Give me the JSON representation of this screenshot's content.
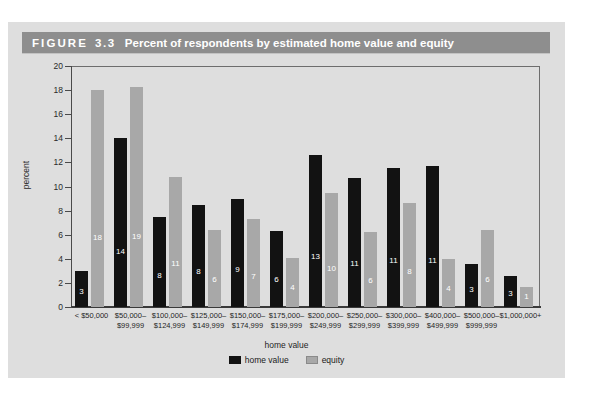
{
  "figure": {
    "label": "FIGURE",
    "number": "3.3",
    "title": "Percent of respondents by estimated home value and equity"
  },
  "colors": {
    "panel_background": "#dedede",
    "header_background": "#8e8e8e",
    "header_text": "#ffffff",
    "home_value_bar": "#121212",
    "equity_bar": "#a8a8a8",
    "axis": "#4a4a4a"
  },
  "chart_data": {
    "type": "bar",
    "title": "Percent of respondents by estimated home value and equity",
    "xlabel": "home value",
    "ylabel": "percent",
    "ylim": [
      0,
      20
    ],
    "yticks": [
      0,
      2,
      4,
      6,
      8,
      10,
      12,
      14,
      16,
      18,
      20
    ],
    "grid": false,
    "legend_position": "bottom-center",
    "categories": [
      "< $50,000",
      "$50,000–$99,999",
      "$100,000–$124,999",
      "$125,000–$149,999",
      "$150,000–$174,999",
      "$175,000–$199,999",
      "$200,000–$249,999",
      "$250,000–$299,999",
      "$300,000–$399,999",
      "$400,000–$499,999",
      "$500,000–$999,999",
      "$1,000,000+"
    ],
    "category_lines": [
      [
        "< $50,000",
        ""
      ],
      [
        "$50,000–",
        "$99,999"
      ],
      [
        "$100,000–",
        "$124,999"
      ],
      [
        "$125,000–",
        "$149,999"
      ],
      [
        "$150,000–",
        "$174,999"
      ],
      [
        "$175,000–",
        "$199,999"
      ],
      [
        "$200,000–",
        "$249,999"
      ],
      [
        "$250,000–",
        "$299,999"
      ],
      [
        "$300,000–",
        "$399,999"
      ],
      [
        "$400,000–",
        "$499,999"
      ],
      [
        "$500,000–",
        "$999,999"
      ],
      [
        "$1,000,000+",
        ""
      ]
    ],
    "series": [
      {
        "name": "home value",
        "color": "#121212",
        "values": [
          3.0,
          14.0,
          7.5,
          8.5,
          9.0,
          6.3,
          12.6,
          10.7,
          11.5,
          11.7,
          3.6,
          2.6
        ],
        "labels": [
          "3",
          "14",
          "8",
          "8",
          "9",
          "6",
          "13",
          "11",
          "11",
          "11",
          "3",
          "3"
        ]
      },
      {
        "name": "equity",
        "color": "#a8a8a8",
        "values": [
          18.0,
          18.3,
          10.8,
          6.4,
          7.3,
          4.1,
          9.5,
          6.2,
          8.6,
          4.0,
          6.4,
          1.7
        ],
        "labels": [
          "18",
          "19",
          "11",
          "6",
          "7",
          "4",
          "10",
          "6",
          "8",
          "4",
          "6",
          "1"
        ]
      }
    ]
  },
  "legend": {
    "items": [
      {
        "label": "home value",
        "swatch": "home"
      },
      {
        "label": "equity",
        "swatch": "equity"
      }
    ]
  }
}
